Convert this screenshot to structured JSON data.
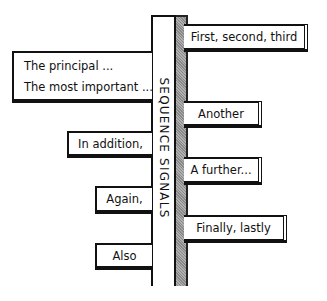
{
  "diagram": {
    "title": "SEQUENCE SIGNALS",
    "left_signs": [
      {
        "lines": [
          "The principal ...",
          "The most important ..."
        ]
      },
      {
        "label": "In addition,"
      },
      {
        "label": "Again,"
      },
      {
        "label": "Also"
      }
    ],
    "right_signs": [
      {
        "label": "First, second, third"
      },
      {
        "label": "Another"
      },
      {
        "label": "A further..."
      },
      {
        "label": "Finally, lastly"
      }
    ],
    "colors": {
      "ink": "#111111",
      "post_shade": "#9a9a9a",
      "background": "#ffffff"
    }
  }
}
